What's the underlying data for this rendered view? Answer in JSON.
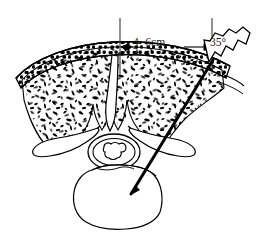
{
  "figure": {
    "kind": "medical-line-drawing",
    "background_color": "#ffffff",
    "ink_color": "#000000"
  },
  "annotations": {
    "distance": {
      "text": "4~6cm",
      "meaning": "lateral distance from midline to needle entry point",
      "arrow": "double-headed horizontal"
    },
    "angle": {
      "text": "35°",
      "meaning": "needle insertion angle from the vertical reference line"
    }
  },
  "reference_lines": {
    "midline": "vertical line at spinous process midline",
    "entry_line": "vertical line at skin entry point"
  },
  "anatomy": [
    {
      "name": "skin-fascia-band",
      "label": "skin and fascia layer"
    },
    {
      "name": "paraspinal-muscle",
      "label": "paraspinal muscle"
    },
    {
      "name": "spinous-process",
      "label": "spinous process"
    },
    {
      "name": "transverse-process-left",
      "label": "left transverse process"
    },
    {
      "name": "transverse-process-right",
      "label": "right transverse process"
    },
    {
      "name": "spinal-canal",
      "label": "spinal canal"
    },
    {
      "name": "spinal-cord",
      "label": "spinal cord"
    },
    {
      "name": "vertebral-body",
      "label": "vertebral body"
    }
  ],
  "instrument": {
    "name": "pedicle-needle",
    "label": "insertion needle with threaded handle",
    "entry_point": "right paraspinal skin",
    "tip_location": "vertebral body"
  }
}
